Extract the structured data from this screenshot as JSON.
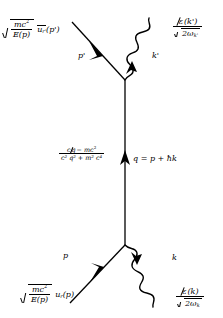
{
  "diagram": {
    "ink_color": "#000000",
    "background_color": "#ffffff",
    "labels": {
      "outgoing_fermion_factor": {
        "sqrt_num": "mc",
        "sqrt_num_sup": "2",
        "sqrt_den": "E(p)",
        "spinor": "u",
        "spinor_sub": "r'",
        "spinor_arg": "(p')",
        "spinor_bar": true
      },
      "outgoing_photon_factor": {
        "num_symbol": "ε",
        "num_arg": "(k')",
        "den_sqrt": "2ω",
        "den_sub": "k'"
      },
      "propagator": {
        "num_lead": "c",
        "num_slash": "q",
        "num_rest_minus": "− mc",
        "num_rest_sup": "2",
        "den": "c² q² + m² c⁴",
        "den_terms": [
          {
            "base": "c",
            "sup": "2"
          },
          {
            "base": "q",
            "sup": "2"
          },
          {
            "op": "+"
          },
          {
            "base": "m",
            "sup": "2"
          },
          {
            "base": "c",
            "sup": "4"
          }
        ]
      },
      "momentum_relation": "q = p + ħk",
      "incoming_fermion_factor": {
        "sqrt_num": "mc",
        "sqrt_num_sup": "2",
        "sqrt_den": "E(p)",
        "spinor": "u",
        "spinor_sub": "r",
        "spinor_arg": "(p)",
        "spinor_bar": false
      },
      "incoming_photon_factor": {
        "num_symbol": "ε",
        "num_arg": "(k)",
        "den_sqrt": "2ω",
        "den_sub": "k"
      },
      "line_momenta": {
        "outgoing_fermion": "p'",
        "outgoing_photon": "k'",
        "incoming_fermion": "p",
        "incoming_photon": "k"
      }
    },
    "geometry": {
      "top_vertex": "(125, 80)",
      "bottom_vertex": "(125, 245)",
      "internal_line_direction": "upward",
      "internal_arrow_at": "(125, 163)"
    }
  }
}
